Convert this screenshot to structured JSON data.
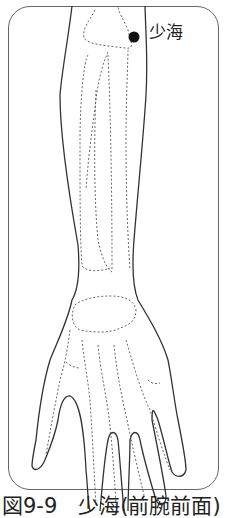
{
  "figure": {
    "point_label": "少海",
    "caption": "図9-9　少海(前腕前面)",
    "colors": {
      "outline": "#333333",
      "bone_dashed": "#555555",
      "frame": "#666666",
      "point": "#111111"
    }
  }
}
